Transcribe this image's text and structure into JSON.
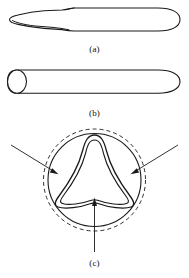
{
  "figure": {
    "background_color": "#ffffff",
    "line_color": "#1a1a1a",
    "panels": [
      {
        "id": "a",
        "caption": "(a)",
        "name": "chisel-side-view",
        "description": "Side elevation of an elongated tool with a tapered chisel point at the left and a rounded cap at the right"
      },
      {
        "id": "b",
        "caption": "(b)",
        "name": "cylindrical-rod-view",
        "description": "Cylindrical rod shown with an elliptical end face at the left and a rounded cap at the right"
      },
      {
        "id": "c",
        "caption": "(c)",
        "name": "cross-section-view",
        "description": "End cross-section: solid circle with concentric dashed circle and a tri-lobed rounded-triangle profile, with three inward-pointing arrows"
      }
    ]
  },
  "captions": {
    "a": "(a)",
    "b": "(b)",
    "c": "(c)"
  },
  "cross_section": {
    "arrows": [
      {
        "name": "arrow-upper-left",
        "direction": "points down-right toward center"
      },
      {
        "name": "arrow-upper-right",
        "direction": "points down-left toward center"
      },
      {
        "name": "arrow-bottom",
        "direction": "points up toward center"
      }
    ],
    "circles": [
      {
        "name": "outer-dashed-circle",
        "style": "dashed"
      },
      {
        "name": "inner-solid-circle",
        "style": "solid"
      }
    ],
    "lobes": [
      {
        "name": "lobe-outer-contour"
      },
      {
        "name": "lobe-inner-contour"
      }
    ]
  }
}
